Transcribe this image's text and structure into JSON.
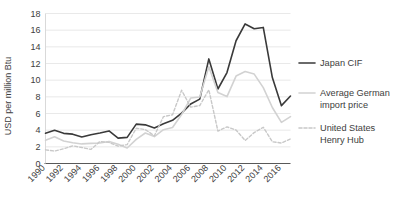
{
  "chart_data": {
    "type": "line",
    "title": "",
    "xlabel": "",
    "ylabel": "USD per million Btu",
    "ylim": [
      0,
      18
    ],
    "yticks": [
      0,
      2,
      4,
      6,
      8,
      10,
      12,
      14,
      16,
      18
    ],
    "xlim": [
      1990,
      2017
    ],
    "xticks": [
      1990,
      1992,
      1994,
      1996,
      1998,
      2000,
      2002,
      2004,
      2006,
      2008,
      2010,
      2012,
      2014,
      2016
    ],
    "xticklabels": [
      "1990",
      "1992",
      "1994",
      "1996",
      "1998",
      "2000",
      "2002",
      "2004",
      "2006",
      "2008",
      "2010",
      "2012",
      "2014",
      "2016"
    ],
    "grid": "horizontal",
    "legend_position": "right",
    "x": [
      1990,
      1991,
      1992,
      1993,
      1994,
      1995,
      1996,
      1997,
      1998,
      1999,
      2000,
      2001,
      2002,
      2003,
      2004,
      2005,
      2006,
      2007,
      2008,
      2009,
      2010,
      2011,
      2012,
      2013,
      2014,
      2015,
      2016,
      2017
    ],
    "series": [
      {
        "name": "Japan CIF",
        "color": "#3a3a3a",
        "style": "solid",
        "width": 1.6,
        "values": [
          3.64,
          3.99,
          3.62,
          3.52,
          3.18,
          3.46,
          3.66,
          3.91,
          3.05,
          3.14,
          4.72,
          4.64,
          4.27,
          4.77,
          5.18,
          6.05,
          7.14,
          7.73,
          12.55,
          8.94,
          10.91,
          14.73,
          16.75,
          16.17,
          16.33,
          10.31,
          6.94,
          8.1
        ],
        "segments": "full"
      },
      {
        "name": "Average German import price",
        "color": "#d2d2d2",
        "style": "solid",
        "width": 1.6,
        "values": [
          2.79,
          3.21,
          2.69,
          2.5,
          2.35,
          2.42,
          2.46,
          2.65,
          2.32,
          1.86,
          2.89,
          3.66,
          3.23,
          4.06,
          4.32,
          5.87,
          7.85,
          7.98,
          11.6,
          8.53,
          8.03,
          10.49,
          11.03,
          10.73,
          9.11,
          6.72,
          4.93,
          5.62
        ],
        "segments": "full"
      },
      {
        "name": "United States Henry Hub",
        "color": "#c8c8c8",
        "style": "dashed",
        "width": 1.4,
        "values": [
          1.64,
          1.49,
          1.77,
          2.12,
          1.92,
          1.69,
          2.64,
          2.53,
          2.08,
          2.27,
          4.23,
          4.07,
          3.33,
          5.63,
          5.85,
          8.79,
          6.76,
          6.95,
          8.85,
          3.89,
          4.39,
          4.01,
          2.76,
          3.71,
          4.35,
          2.6,
          2.46,
          2.96
        ],
        "segments": "full"
      }
    ],
    "legend": [
      {
        "label_line1": "Japan CIF",
        "label_line2": "",
        "color": "#3a3a3a",
        "style": "solid"
      },
      {
        "label_line1": "Average German",
        "label_line2": "import price",
        "color": "#d2d2d2",
        "style": "solid"
      },
      {
        "label_line1": "United States",
        "label_line2": "Henry Hub",
        "color": "#c8c8c8",
        "style": "dashed"
      }
    ]
  },
  "axes": {
    "y_title": "USD per million Btu",
    "gridline_color": "#e0e0e0",
    "axis_color": "#595959"
  }
}
